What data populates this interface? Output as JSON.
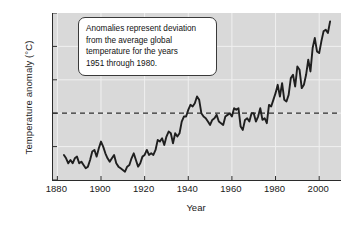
{
  "chart_data": {
    "type": "line",
    "title": "",
    "xlabel": "Year",
    "ylabel": "Temperature anomaly (°C)",
    "xlim": [
      1878,
      2010
    ],
    "ylim": [
      -0.4,
      0.6
    ],
    "xticks": [
      "1880",
      "1900",
      "1920",
      "1940",
      "1960",
      "1980",
      "2000"
    ],
    "xtick_values": [
      1880,
      1900,
      1920,
      1940,
      1960,
      1980,
      2000
    ],
    "yticks": [
      "0.6",
      "0.4",
      "0.2",
      "0",
      "−0.2",
      "−0.4"
    ],
    "ytick_values": [
      0.6,
      0.4,
      0.2,
      0,
      -0.2,
      -0.4
    ],
    "grid": true,
    "legend": "none",
    "reference_line": {
      "value": 0,
      "style": "dashed",
      "label": ""
    },
    "series": [
      {
        "name": "Global temperature anomaly",
        "color": "#1f1f1f",
        "x": [
          1883,
          1884,
          1885,
          1886,
          1887,
          1888,
          1889,
          1890,
          1891,
          1892,
          1893,
          1894,
          1895,
          1896,
          1897,
          1898,
          1899,
          1900,
          1901,
          1902,
          1903,
          1904,
          1905,
          1906,
          1907,
          1908,
          1909,
          1910,
          1911,
          1912,
          1913,
          1914,
          1915,
          1916,
          1917,
          1918,
          1919,
          1920,
          1921,
          1922,
          1923,
          1924,
          1925,
          1926,
          1927,
          1928,
          1929,
          1930,
          1931,
          1932,
          1933,
          1934,
          1935,
          1936,
          1937,
          1938,
          1939,
          1940,
          1941,
          1942,
          1943,
          1944,
          1945,
          1946,
          1947,
          1948,
          1949,
          1950,
          1951,
          1952,
          1953,
          1954,
          1955,
          1956,
          1957,
          1958,
          1959,
          1960,
          1961,
          1962,
          1963,
          1964,
          1965,
          1966,
          1967,
          1968,
          1969,
          1970,
          1971,
          1972,
          1973,
          1974,
          1975,
          1976,
          1977,
          1978,
          1979,
          1980,
          1981,
          1982,
          1983,
          1984,
          1985,
          1986,
          1987,
          1988,
          1989,
          1990,
          1991,
          1992,
          1993,
          1994,
          1995,
          1996,
          1997,
          1998,
          1999,
          2000,
          2001,
          2002,
          2003,
          2004,
          2005
        ],
        "y": [
          -0.25,
          -0.27,
          -0.3,
          -0.28,
          -0.3,
          -0.27,
          -0.26,
          -0.3,
          -0.29,
          -0.31,
          -0.33,
          -0.32,
          -0.28,
          -0.23,
          -0.22,
          -0.26,
          -0.21,
          -0.17,
          -0.2,
          -0.24,
          -0.27,
          -0.29,
          -0.27,
          -0.25,
          -0.3,
          -0.32,
          -0.33,
          -0.34,
          -0.35,
          -0.32,
          -0.31,
          -0.27,
          -0.24,
          -0.28,
          -0.32,
          -0.3,
          -0.26,
          -0.25,
          -0.22,
          -0.25,
          -0.24,
          -0.25,
          -0.22,
          -0.16,
          -0.17,
          -0.15,
          -0.19,
          -0.14,
          -0.11,
          -0.12,
          -0.18,
          -0.12,
          -0.14,
          -0.12,
          -0.05,
          -0.02,
          -0.02,
          0.02,
          0.05,
          0.04,
          0.06,
          0.1,
          0.08,
          0.0,
          -0.02,
          -0.03,
          -0.05,
          -0.07,
          -0.04,
          -0.03,
          -0.01,
          -0.05,
          -0.06,
          -0.07,
          -0.02,
          -0.01,
          0.0,
          -0.02,
          0.03,
          0.02,
          0.03,
          -0.08,
          -0.1,
          -0.04,
          -0.03,
          -0.05,
          0.0,
          0.0,
          -0.05,
          -0.02,
          0.03,
          -0.04,
          -0.03,
          -0.06,
          0.05,
          0.04,
          0.08,
          0.12,
          0.17,
          0.1,
          0.18,
          0.08,
          0.07,
          0.11,
          0.21,
          0.23,
          0.16,
          0.28,
          0.26,
          0.15,
          0.17,
          0.23,
          0.32,
          0.25,
          0.39,
          0.45,
          0.37,
          0.36,
          0.43,
          0.49,
          0.5,
          0.48,
          0.55
        ]
      }
    ],
    "annotations": [
      {
        "name": "anomaly-definition-callout",
        "lines": [
          "Anomalies represent deviation",
          "from the average global",
          "temperature for the years",
          "1951 through 1980."
        ],
        "points_to_year": 1955,
        "points_to_value": -0.03
      }
    ],
    "colors": {
      "plot_background": "#d9d9d9",
      "line": "#1f1f1f",
      "gridline": "#f0f0f0",
      "axis": "#2b2b2b",
      "callout_background": "#ffffff",
      "callout_border": "#3a3a3a",
      "figure_background": "#ffffff"
    }
  }
}
